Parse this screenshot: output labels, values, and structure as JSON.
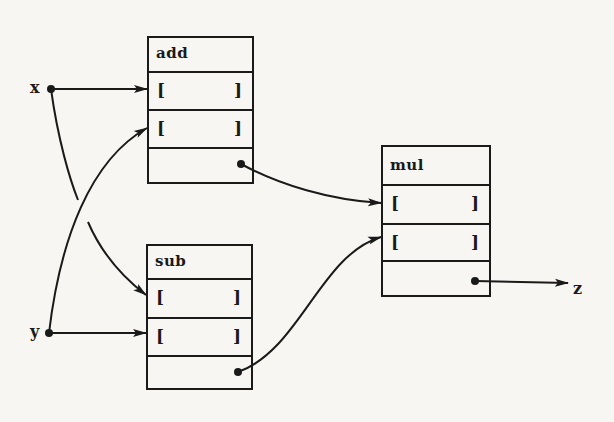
{
  "diagram": {
    "type": "dataflow",
    "inputs": [
      {
        "id": "x",
        "label": "x"
      },
      {
        "id": "y",
        "label": "y"
      }
    ],
    "output": {
      "id": "z",
      "label": "z"
    },
    "nodes": [
      {
        "id": "add",
        "label": "add",
        "slots": [
          {
            "open": "[",
            "close": "]"
          },
          {
            "open": "[",
            "close": "]"
          }
        ],
        "result": ""
      },
      {
        "id": "sub",
        "label": "sub",
        "slots": [
          {
            "open": "[",
            "close": "]"
          },
          {
            "open": "[",
            "close": "]"
          }
        ],
        "result": ""
      },
      {
        "id": "mul",
        "label": "mul",
        "slots": [
          {
            "open": "[",
            "close": "]"
          },
          {
            "open": "[",
            "close": "]"
          }
        ],
        "result": ""
      }
    ],
    "edges": [
      {
        "from": "x",
        "to": "add.slot1"
      },
      {
        "from": "x",
        "to": "sub.slot1"
      },
      {
        "from": "y",
        "to": "add.slot2"
      },
      {
        "from": "y",
        "to": "sub.slot2"
      },
      {
        "from": "add.result",
        "to": "mul.slot1"
      },
      {
        "from": "sub.result",
        "to": "mul.slot2"
      },
      {
        "from": "mul.result",
        "to": "z"
      }
    ],
    "colors": {
      "ink": "#1a1a1a",
      "paper": "#f7f6f3"
    }
  }
}
